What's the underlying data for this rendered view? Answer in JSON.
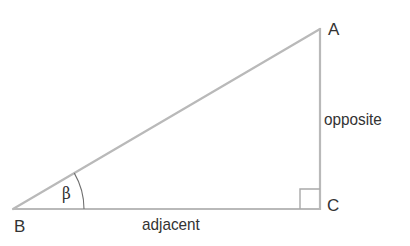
{
  "diagram": {
    "type": "right-triangle",
    "colors": {
      "line": "#b9b9b9",
      "arc": "#6e6e6e",
      "text": "#333333",
      "background": "#ffffff"
    },
    "vertices": {
      "A": {
        "label": "A",
        "x": 320,
        "y": 29
      },
      "B": {
        "label": "B",
        "x": 13,
        "y": 209
      },
      "C": {
        "label": "C",
        "x": 320,
        "y": 209
      }
    },
    "sides": {
      "opposite": {
        "label": "opposite"
      },
      "adjacent": {
        "label": "adjacent"
      }
    },
    "angle": {
      "label": "β",
      "vertex": "B",
      "arc_radius": 71
    },
    "right_angle_marker": {
      "vertex": "C",
      "size": 20
    }
  }
}
